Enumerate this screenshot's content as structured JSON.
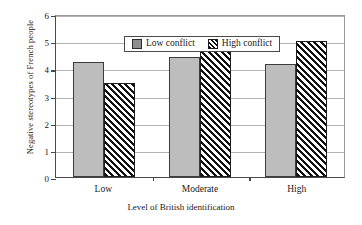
{
  "chart_data": {
    "type": "bar",
    "title": "",
    "xlabel": "Level of British identification",
    "ylabel": "Negative stereotypes of French people",
    "categories": [
      "Low",
      "Moderate",
      "High"
    ],
    "series": [
      {
        "name": "Low conflict",
        "values": [
          4.25,
          4.4,
          4.15
        ]
      },
      {
        "name": "High conflict",
        "values": [
          3.45,
          4.7,
          5.0
        ]
      }
    ],
    "ylim": [
      0,
      6
    ],
    "yticks": [
      0,
      1,
      2,
      3,
      4,
      5,
      6
    ],
    "ytick_labels": [
      "0",
      "1",
      "2",
      "3",
      "4",
      "5",
      "6"
    ],
    "grid": true,
    "legend_position": "top-center",
    "colors": {
      "low_conflict": "#bdbdbd",
      "high_conflict": "#ffffff",
      "axis": "#4a4a4a",
      "grid": "#b4b4b4"
    }
  },
  "legend": {
    "items": [
      {
        "label": "Low conflict"
      },
      {
        "label": "High conflict"
      }
    ]
  }
}
